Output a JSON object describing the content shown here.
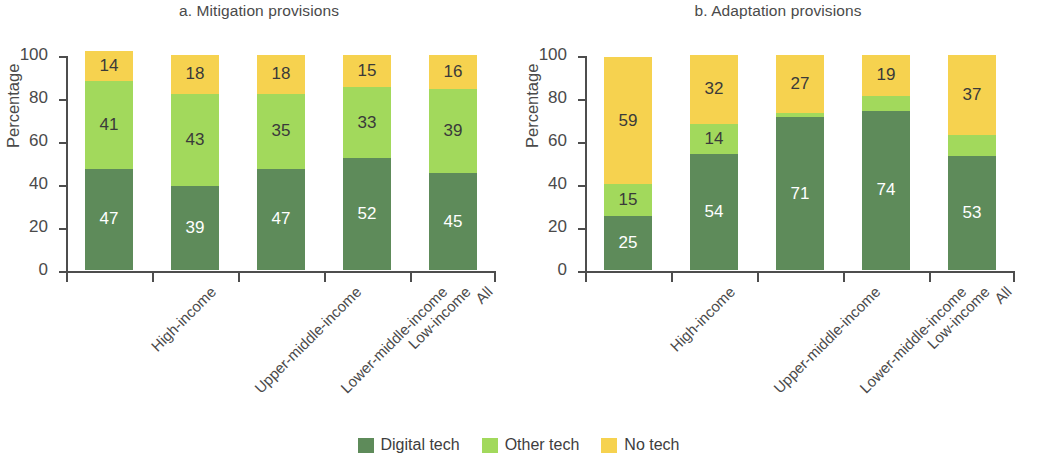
{
  "figure": {
    "legend": {
      "position": "bottom-center",
      "items": [
        {
          "label": "Digital tech",
          "color": "#5e8b5a",
          "key": "digital"
        },
        {
          "label": "Other tech",
          "color": "#a2d95c",
          "key": "other"
        },
        {
          "label": "No tech",
          "color": "#f6d24f",
          "key": "no"
        }
      ]
    }
  },
  "chart_data": [
    {
      "type": "bar",
      "stacked": true,
      "title": "a. Mitigation provisions",
      "xlabel": "",
      "ylabel": "Percentage",
      "ylim": [
        0,
        100
      ],
      "yticks": [
        0,
        20,
        40,
        60,
        80,
        100
      ],
      "ytick_labels": [
        "0",
        "20",
        "40",
        "60",
        "80",
        "100"
      ],
      "grid": false,
      "legend": "bottom",
      "categories": [
        "High-income",
        "Upper-middle-income",
        "Lower-middle-income",
        "Low-income",
        "All"
      ],
      "series": [
        {
          "name": "Digital tech",
          "color": "#5e8b5a",
          "label_color": "#ffffff",
          "values": [
            47,
            39,
            47,
            52,
            45
          ]
        },
        {
          "name": "Other tech",
          "color": "#a2d95c",
          "label_color": "#3a3a3a",
          "values": [
            41,
            43,
            35,
            33,
            39
          ]
        },
        {
          "name": "No tech",
          "color": "#f6d24f",
          "label_color": "#3a3a3a",
          "values": [
            14,
            18,
            18,
            15,
            16
          ]
        }
      ]
    },
    {
      "type": "bar",
      "stacked": true,
      "title": "b. Adaptation provisions",
      "xlabel": "",
      "ylabel": "Percentage",
      "ylim": [
        0,
        100
      ],
      "yticks": [
        0,
        20,
        40,
        60,
        80,
        100
      ],
      "ytick_labels": [
        "0",
        "20",
        "40",
        "60",
        "80",
        "100"
      ],
      "grid": false,
      "legend": "bottom",
      "categories": [
        "High-income",
        "Upper-middle-income",
        "Lower-middle-income",
        "Low-income",
        "All"
      ],
      "series": [
        {
          "name": "Digital tech",
          "color": "#5e8b5a",
          "label_color": "#ffffff",
          "values": [
            25,
            54,
            71,
            74,
            53
          ]
        },
        {
          "name": "Other tech",
          "color": "#a2d95c",
          "label_color": "#3a3a3a",
          "values": [
            15,
            14,
            2,
            7,
            10
          ]
        },
        {
          "name": "No tech",
          "color": "#f6d24f",
          "label_color": "#3a3a3a",
          "values": [
            59,
            32,
            27,
            19,
            37
          ]
        }
      ]
    }
  ]
}
